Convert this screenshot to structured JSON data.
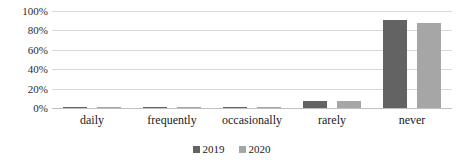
{
  "chart_data": {
    "type": "bar",
    "title": "",
    "subtitle": "",
    "xlabel": "",
    "ylabel": "",
    "categories": [
      "daily",
      "frequently",
      "occasionally",
      "rarely",
      "never"
    ],
    "series": [
      {
        "name": "2019",
        "color": "#636363",
        "values": [
          1,
          1,
          1,
          7,
          91
        ]
      },
      {
        "name": "2020",
        "color": "#a6a6a6",
        "values": [
          1,
          1,
          1,
          7,
          88
        ]
      }
    ],
    "ylim": [
      0,
      100
    ],
    "yticks": [
      0,
      20,
      40,
      60,
      80,
      100
    ],
    "ytick_labels": [
      "0%",
      "20%",
      "40%",
      "60%",
      "80%",
      "100%"
    ],
    "grid": true,
    "legend_position": "bottom",
    "value_format": "percent"
  },
  "legend": {
    "items": [
      {
        "label": "2019",
        "color": "#636363"
      },
      {
        "label": "2020",
        "color": "#a6a6a6"
      }
    ]
  }
}
